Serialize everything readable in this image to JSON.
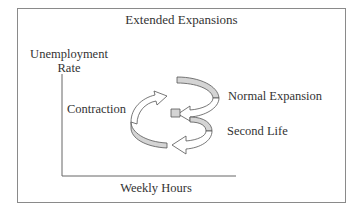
{
  "diagram": {
    "title": "Extended Expansions",
    "y_axis_label_line1": "Unemployment",
    "y_axis_label_line2": "Rate",
    "x_axis_label": "Weekly Hours",
    "phases": [
      {
        "label": "Contraction"
      },
      {
        "label": "Normal Expansion"
      },
      {
        "label": "Second Life"
      }
    ],
    "colors": {
      "frame": "#8a8a8a",
      "arrow_fill_shaded": "#d4d4d4",
      "arrow_fill_light": "#ffffff",
      "arrow_stroke": "#555555",
      "text": "#333333"
    }
  }
}
